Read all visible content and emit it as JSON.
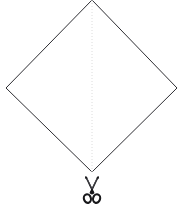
{
  "figure": {
    "background_color": "#ffffff",
    "canvas": {
      "width": 179,
      "height": 206
    },
    "outline_color": "#2e2e33",
    "fold_line_color": "#dcdcdc",
    "scissors_color": "#18181b",
    "caption": "",
    "labels": {
      "shape": "diamond-outline",
      "fold": "vertical-dotted-fold-line",
      "tool": "scissors"
    }
  },
  "chart_data": {
    "type": "diagram",
    "elements": [
      {
        "name": "diamond-outline",
        "kind": "polygon",
        "stroke": "#2e2e33",
        "fill": "#ffffff",
        "points": [
          [
            92,
            0
          ],
          [
            177,
            88
          ],
          [
            92,
            172
          ],
          [
            6,
            88
          ]
        ]
      },
      {
        "name": "vertical-dotted-fold-line",
        "kind": "dashed-line",
        "stroke": "#dcdcdc",
        "points": [
          [
            92,
            0
          ],
          [
            92,
            172
          ]
        ]
      },
      {
        "name": "scissors",
        "kind": "icon",
        "stroke": "#18181b",
        "bbox": [
          84,
          176,
          16,
          28
        ],
        "anchor": [
          92,
          176
        ]
      }
    ],
    "xlim": [
      0,
      179
    ],
    "ylim": [
      0,
      206
    ],
    "grid": false,
    "legend": "none"
  }
}
